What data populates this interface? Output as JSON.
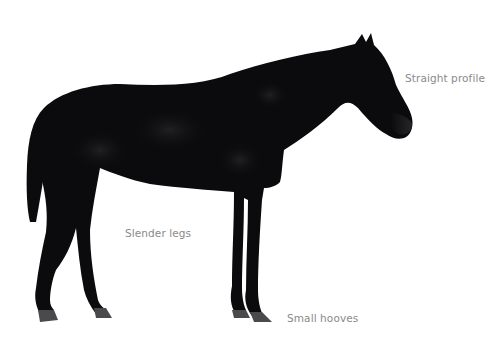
{
  "image": {
    "subject": "Horse in side profile (black/dark bay) on white background",
    "background_color": "#ffffff",
    "body_color": "#0b0b0d",
    "hoof_color": "#4a4a4c"
  },
  "annotations": [
    {
      "id": "profile",
      "text": "Straight profile"
    },
    {
      "id": "legs",
      "text": "Slender legs"
    },
    {
      "id": "hooves",
      "text": "Small hooves"
    }
  ]
}
